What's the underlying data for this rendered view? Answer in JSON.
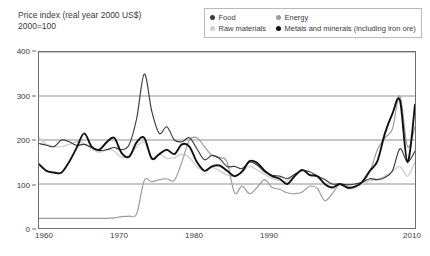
{
  "header": {
    "title_line1": "Price index (real year 2000 US$)",
    "title_line2": "2000=100"
  },
  "legend": {
    "position": "top-right",
    "entries": [
      {
        "label": "Food",
        "color": "#3a3a3a"
      },
      {
        "label": "Energy",
        "color": "#9a9a9a"
      },
      {
        "label": "Raw materials",
        "color": "#cfcfcf"
      },
      {
        "label": "Metals and minerals (including iron ore)",
        "color": "#111111"
      }
    ]
  },
  "axes": {
    "y_ticks": [
      "0",
      "100",
      "200",
      "300",
      "400"
    ],
    "x_ticks": [
      "1960",
      "1970",
      "1980",
      "1990",
      "2010"
    ]
  },
  "chart_data": {
    "type": "line",
    "title": "Price index (real year 2000 US$)",
    "subtitle": "2000=100",
    "xlabel": "",
    "ylabel": "Price index (real year 2000 US$), 2000=100",
    "xlim": [
      1960,
      2010
    ],
    "ylim": [
      0,
      400
    ],
    "ytick_values": [
      0,
      100,
      200,
      300,
      400
    ],
    "xtick_values": [
      1960,
      1970,
      1980,
      1990,
      2010
    ],
    "xtick_labels": [
      "1960",
      "1970",
      "1980",
      "1990",
      "2010"
    ],
    "grid": "horizontal",
    "legend_position": "top-right",
    "x": [
      1960,
      1961,
      1962,
      1963,
      1964,
      1965,
      1966,
      1967,
      1968,
      1969,
      1970,
      1971,
      1972,
      1973,
      1974,
      1975,
      1976,
      1977,
      1978,
      1979,
      1980,
      1981,
      1982,
      1983,
      1984,
      1985,
      1986,
      1987,
      1988,
      1989,
      1990,
      1991,
      1992,
      1993,
      1994,
      1995,
      1996,
      1997,
      1998,
      1999,
      2000,
      2001,
      2002,
      2003,
      2004,
      2005,
      2006,
      2007,
      2008,
      2009,
      2010
    ],
    "series": [
      {
        "name": "Food",
        "color": "#3a3a3a",
        "values": [
          192,
          188,
          185,
          200,
          196,
          188,
          190,
          183,
          176,
          178,
          183,
          178,
          190,
          250,
          350,
          265,
          215,
          230,
          200,
          196,
          205,
          180,
          155,
          165,
          158,
          140,
          140,
          135,
          150,
          143,
          128,
          120,
          118,
          112,
          122,
          130,
          128,
          118,
          110,
          100,
          100,
          98,
          100,
          104,
          112,
          110,
          115,
          130,
          180,
          150,
          175
        ]
      },
      {
        "name": "Energy",
        "color": "#9a9a9a",
        "values": [
          22,
          22,
          22,
          22,
          22,
          22,
          22,
          22,
          22,
          22,
          23,
          26,
          27,
          33,
          108,
          105,
          110,
          112,
          108,
          150,
          200,
          205,
          185,
          165,
          160,
          150,
          80,
          95,
          78,
          92,
          110,
          92,
          88,
          80,
          78,
          82,
          95,
          90,
          62,
          78,
          100,
          90,
          92,
          105,
          128,
          178,
          205,
          225,
          300,
          185,
          230
        ]
      },
      {
        "name": "Raw materials",
        "color": "#cfcfcf",
        "values": [
          205,
          190,
          185,
          185,
          190,
          196,
          192,
          180,
          172,
          178,
          175,
          160,
          165,
          185,
          195,
          160,
          168,
          158,
          160,
          168,
          160,
          140,
          130,
          138,
          130,
          120,
          118,
          128,
          140,
          132,
          122,
          112,
          108,
          106,
          118,
          132,
          122,
          118,
          102,
          100,
          100,
          92,
          93,
          100,
          108,
          110,
          118,
          128,
          140,
          118,
          150
        ]
      },
      {
        "name": "Metals and minerals (including iron ore)",
        "color": "#111111",
        "values": [
          145,
          130,
          126,
          126,
          150,
          182,
          215,
          185,
          178,
          195,
          205,
          170,
          162,
          195,
          205,
          158,
          168,
          178,
          168,
          190,
          185,
          150,
          130,
          140,
          142,
          130,
          118,
          128,
          152,
          148,
          130,
          118,
          112,
          100,
          118,
          132,
          120,
          118,
          100,
          92,
          100,
          92,
          94,
          105,
          130,
          152,
          215,
          260,
          290,
          150,
          280
        ]
      }
    ],
    "annotations": [
      {
        "text": "Food price spike",
        "x": 1974,
        "y": 350
      },
      {
        "text": "Oil shock: energy jumps from ~22 to ~110",
        "x": 1974,
        "y": 110
      },
      {
        "text": "Commodity boom peak",
        "x": 2008,
        "y": 300
      }
    ]
  }
}
